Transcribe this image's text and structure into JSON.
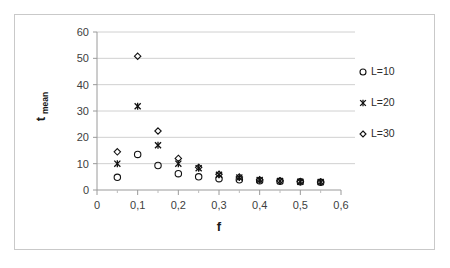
{
  "chart_data": {
    "type": "scatter",
    "title": "",
    "xlabel": "f",
    "ylabel": "t_mean",
    "ylabel_base": "t",
    "ylabel_sub": "mean",
    "xlim": [
      0,
      0.6
    ],
    "ylim": [
      0,
      60
    ],
    "xticks": [
      "0",
      "0,1",
      "0,2",
      "0,3",
      "0,4",
      "0,5",
      "0,6"
    ],
    "xtick_values": [
      0,
      0.1,
      0.2,
      0.3,
      0.4,
      0.5,
      0.6
    ],
    "yticks": [
      "0",
      "10",
      "20",
      "30",
      "40",
      "50",
      "60"
    ],
    "ytick_values": [
      0,
      10,
      20,
      30,
      40,
      50,
      60
    ],
    "grid": true,
    "grid_axis": "y",
    "legend_position": "right",
    "decimal_separator": ",",
    "x": [
      0.05,
      0.1,
      0.15,
      0.2,
      0.25,
      0.3,
      0.35,
      0.4,
      0.45,
      0.5,
      0.55
    ],
    "series": [
      {
        "name": "L=10",
        "marker": "circle",
        "color": "#111111",
        "values": [
          4.8,
          13.5,
          9.3,
          6.2,
          5.0,
          4.3,
          3.9,
          3.5,
          3.3,
          3.1,
          2.9
        ]
      },
      {
        "name": "L=20",
        "marker": "asterisk",
        "color": "#111111",
        "values": [
          10.0,
          31.8,
          17.0,
          10.0,
          8.3,
          5.8,
          4.7,
          3.8,
          3.4,
          3.1,
          3.0
        ]
      },
      {
        "name": "L=30",
        "marker": "diamond",
        "color": "#111111",
        "values": [
          14.5,
          50.8,
          22.4,
          12.0,
          8.6,
          6.0,
          4.9,
          3.9,
          3.5,
          3.2,
          3.0
        ]
      }
    ]
  },
  "legend": {
    "entries": [
      {
        "label": "L=10",
        "marker": "circle"
      },
      {
        "label": "L=20",
        "marker": "asterisk"
      },
      {
        "label": "L=30",
        "marker": "diamond"
      }
    ]
  },
  "colors": {
    "marker": "#111111",
    "gridline": "#d0d0d0",
    "axis": "#9a9a9a",
    "border": "#c9c9c9",
    "background": "#ffffff",
    "tick_text": "#404040"
  }
}
